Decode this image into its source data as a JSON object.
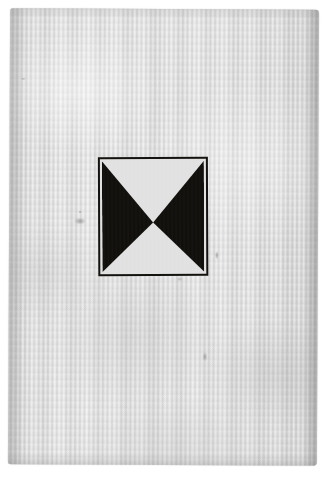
{
  "scan": {
    "width": 332,
    "height": 478,
    "background_color": "#ffffff",
    "caption": "Photographic scan of an aged laid-paper sheet bearing a hand-printed geometric device"
  },
  "paper": {
    "name": "laid-paper-sheet",
    "tone_color": "#dcdcdc",
    "highlight_color": "#e4e4e4",
    "shadow_color": "#c9c9c9",
    "texture": "vertical laid lines",
    "left": 9,
    "top": 9,
    "width": 309,
    "height": 456,
    "rotation_deg": 0.28
  },
  "figure": {
    "name": "bowtie-device",
    "frame_color": "#15130f",
    "ink_color": "#100e0b",
    "ground_color": "#e1e1e1",
    "left": 98,
    "top": 157,
    "width": 110,
    "height": 119,
    "rotation_deg": -0.5,
    "frame_stroke_px": 2,
    "center_point": {
      "x": 0.5,
      "y": 0.555
    },
    "shapes": [
      {
        "name": "left-black-triangle",
        "points": "0,0 0,1 0.5,0.555",
        "color": "#100e0b"
      },
      {
        "name": "right-black-triangle",
        "points": "1,0 1,1 0.5,0.555",
        "color": "#100e0b"
      },
      {
        "name": "top-white-triangle",
        "points": "0,0 1,0 0.5,0.555",
        "color": "#e1e1e1"
      },
      {
        "name": "bottom-white-triangle",
        "points": "0,1 1,1 0.5,0.555",
        "color": "#e1e1e1"
      }
    ]
  },
  "blemishes": [
    {
      "name": "left-smudge",
      "x": 74,
      "y": 218
    },
    {
      "name": "left-dot",
      "x": 78,
      "y": 211
    },
    {
      "name": "lower-speck",
      "x": 203,
      "y": 352
    },
    {
      "name": "upper-left-fleck",
      "x": 20,
      "y": 78
    },
    {
      "name": "below-figure-mark",
      "x": 168,
      "y": 268
    },
    {
      "name": "right-edge-mark",
      "x": 206,
      "y": 242
    }
  ]
}
